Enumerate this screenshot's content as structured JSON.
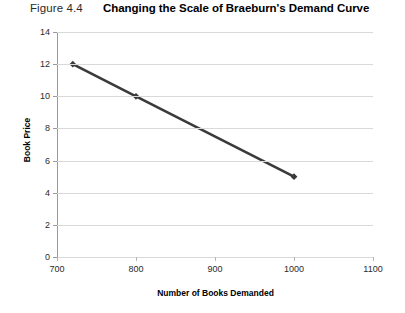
{
  "header": {
    "figure_number": "Figure 4.4",
    "title": "Changing the Scale of Braeburn's Demand Curve"
  },
  "colors": {
    "series_line": "#3a3a3a",
    "gridline": "#d9d9d9",
    "axis": "#9a9a9a",
    "text": "#1a1a1a",
    "background": "#ffffff"
  },
  "chart_data": {
    "type": "line",
    "title": "Changing the Scale of Braeburn's Demand Curve",
    "xlabel": "Number of Books Demanded",
    "ylabel": "Book Price",
    "xlim": [
      700,
      1100
    ],
    "ylim": [
      0,
      14
    ],
    "xticks": [
      700,
      800,
      900,
      1000,
      1100
    ],
    "xtick_labels": [
      "700",
      "800",
      "900",
      "1000",
      "1100"
    ],
    "yticks": [
      0,
      2,
      4,
      6,
      8,
      10,
      12,
      14
    ],
    "ytick_labels": [
      "0",
      "2",
      "4",
      "6",
      "8",
      "10",
      "12",
      "14"
    ],
    "grid": "horizontal",
    "legend": "none",
    "marker": "diamond",
    "series": [
      {
        "name": "Braeburn's Demand Curve",
        "color": "#3a3a3a",
        "x": [
          720,
          800,
          1000
        ],
        "y": [
          12,
          10,
          5
        ],
        "points": [
          {
            "x": 720,
            "y": 12
          },
          {
            "x": 800,
            "y": 10
          },
          {
            "x": 1000,
            "y": 5
          }
        ]
      }
    ]
  }
}
